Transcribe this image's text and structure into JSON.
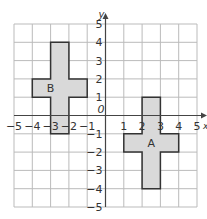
{
  "diagram": {
    "type": "coordinate-grid",
    "x_range": [
      -5,
      5
    ],
    "y_range": [
      -5,
      5
    ],
    "axis_labels": {
      "x": "x",
      "y": "y"
    },
    "origin_label": "0",
    "x_ticks": [
      "-5",
      "-4",
      "-3",
      "-2",
      "-1",
      "1",
      "2",
      "3",
      "4",
      "5"
    ],
    "y_ticks": [
      "5",
      "4",
      "3",
      "2",
      "1",
      "-1",
      "-2",
      "-3",
      "-4",
      "-5"
    ],
    "colors": {
      "grid": "#bbbbbb",
      "axis": "#444444",
      "shape_fill": "#d9d9d9",
      "shape_stroke": "#333333"
    },
    "shapes": [
      {
        "label": "B",
        "label_pos": [
          -3,
          1.5
        ],
        "points": [
          [
            -3,
            4
          ],
          [
            -2,
            4
          ],
          [
            -2,
            2
          ],
          [
            -1,
            2
          ],
          [
            -1,
            1
          ],
          [
            -2,
            1
          ],
          [
            -2,
            -1
          ],
          [
            -3,
            -1
          ],
          [
            -3,
            1
          ],
          [
            -4,
            1
          ],
          [
            -4,
            2
          ],
          [
            -3,
            2
          ]
        ]
      },
      {
        "label": "A",
        "label_pos": [
          2.5,
          -1.5
        ],
        "points": [
          [
            2,
            1
          ],
          [
            3,
            1
          ],
          [
            3,
            -1
          ],
          [
            4,
            -1
          ],
          [
            4,
            -2
          ],
          [
            3,
            -2
          ],
          [
            3,
            -4
          ],
          [
            2,
            -4
          ],
          [
            2,
            -2
          ],
          [
            1,
            -2
          ],
          [
            1,
            -1
          ],
          [
            2,
            -1
          ]
        ]
      }
    ]
  }
}
